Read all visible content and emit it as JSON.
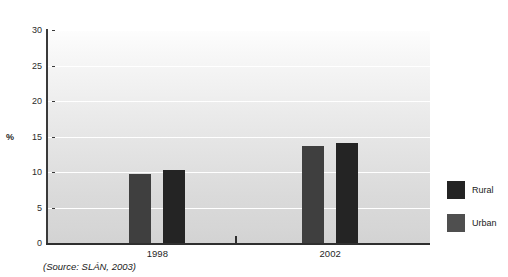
{
  "figure": {
    "title_remnant": "Figure: smoking prevalence by area",
    "source_note": "(Source: SLÁN, 2003)"
  },
  "chart_data": {
    "type": "bar",
    "title": "",
    "xlabel": "",
    "ylabel": "%",
    "categories": [
      "1998",
      "2002"
    ],
    "series": [
      {
        "name": "Rural",
        "values": [
          9.7,
          13.7
        ],
        "color": "#3f3f3f"
      },
      {
        "name": "Urban",
        "values": [
          10.3,
          14.1
        ],
        "color": "#242424"
      }
    ],
    "ylim": [
      0,
      30
    ],
    "yticks": [
      0,
      5,
      10,
      15,
      20,
      25,
      30
    ],
    "ytick_labels": [
      "0",
      "5",
      "10",
      "15",
      "20",
      "25",
      "30"
    ],
    "grid": true,
    "legend_position": "right",
    "plot_background": "#e6e6e6"
  },
  "legend": {
    "entries": [
      {
        "label": "Rural",
        "color": "#242424"
      },
      {
        "label": "Urban",
        "color": "#4f4f4f"
      }
    ]
  }
}
